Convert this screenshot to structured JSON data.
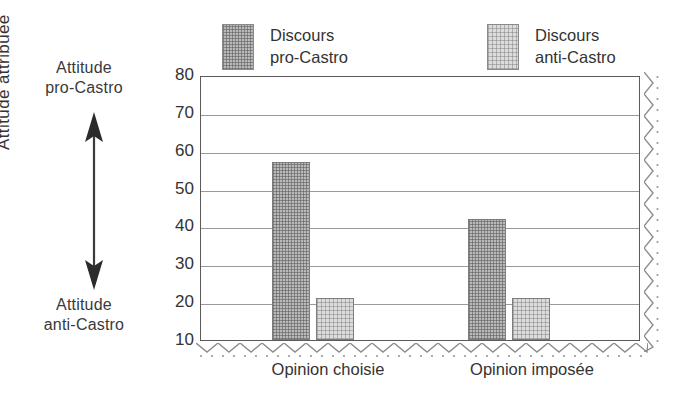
{
  "annotations": {
    "top_label_line1": "Attitude",
    "top_label_line2": "pro-Castro",
    "bottom_label_line1": "Attitude",
    "bottom_label_line2": "anti-Castro",
    "arrow_icon": "double-headed-vertical-arrow-icon"
  },
  "legend": {
    "position": "top",
    "items": [
      {
        "label_line1": "Discours",
        "label_line2": "pro-Castro",
        "swatch_style": "dark-hatch",
        "color": "#b9b9b9"
      },
      {
        "label_line1": "Discours",
        "label_line2": "anti-Castro",
        "swatch_style": "light-hatch",
        "color": "#dcdcdc"
      }
    ]
  },
  "axes": {
    "ylabel": "Attitude attribuée",
    "yticks": [
      80,
      70,
      60,
      50,
      40,
      30,
      20,
      10
    ],
    "ymin": 10,
    "ymax": 80,
    "grid": true,
    "xticklabels": [
      "Opinion choisie",
      "Opinion imposée"
    ]
  },
  "decoration": {
    "bottom_edge": "zigzag-torn-edge",
    "right_edge": "zigzag-torn-edge"
  },
  "chart_data": {
    "type": "bar",
    "title": "",
    "xlabel": "",
    "ylabel": "Attitude attribuée",
    "categories": [
      "Opinion choisie",
      "Opinion imposée"
    ],
    "series": [
      {
        "name": "Discours pro-Castro",
        "values": [
          57,
          42
        ],
        "color": "#b9b9b9"
      },
      {
        "name": "Discours anti-Castro",
        "values": [
          21,
          21
        ],
        "color": "#dcdcdc"
      }
    ],
    "ylim": [
      10,
      80
    ],
    "ytick_step": 10,
    "grid": true,
    "legend_position": "top"
  }
}
